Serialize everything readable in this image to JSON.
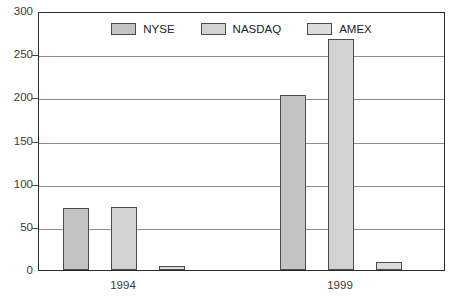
{
  "chart_data": {
    "type": "bar",
    "title": "",
    "subtitle": "",
    "xlabel": "",
    "ylabel": "",
    "categories": [
      "1994",
      "1999"
    ],
    "series": [
      {
        "name": "NYSE",
        "values": [
          72,
          203
        ],
        "color": "#c4c4c4"
      },
      {
        "name": "NASDAQ",
        "values": [
          73,
          268
        ],
        "color": "#d2d2d2"
      },
      {
        "name": "AMEX",
        "values": [
          5,
          9
        ],
        "color": "#dcdcdc"
      }
    ],
    "ylim": [
      0,
      300
    ],
    "ytick_step": 50,
    "yticks": [
      "0",
      "50",
      "100",
      "150",
      "200",
      "250",
      "300"
    ],
    "grid": true,
    "grid_axis": "y",
    "legend_position": "top-center",
    "bar_border_color": "#4c4c4c",
    "frame_color": "#2b2b2b",
    "gridline_color": "#8d8d8d",
    "background_color": "#ffffff"
  },
  "legend": {
    "items": [
      {
        "label": "NYSE"
      },
      {
        "label": "NASDAQ"
      },
      {
        "label": "AMEX"
      }
    ]
  },
  "axes": {
    "y_ticks": [
      {
        "value": "300"
      },
      {
        "value": "250"
      },
      {
        "value": "200"
      },
      {
        "value": "150"
      },
      {
        "value": "100"
      },
      {
        "value": "50"
      },
      {
        "value": "0"
      }
    ],
    "x_categories": [
      {
        "label": "1994"
      },
      {
        "label": "1999"
      }
    ]
  }
}
